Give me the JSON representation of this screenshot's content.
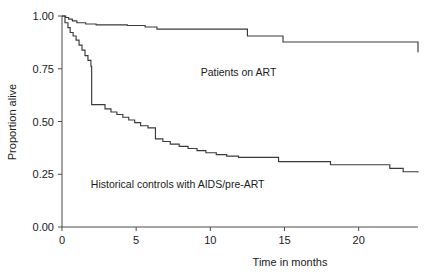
{
  "chart_data": {
    "type": "line",
    "title": "",
    "subtitle": "",
    "xlabel": "Time in months",
    "ylabel": "Proportion alive",
    "xlim": [
      0,
      24
    ],
    "ylim": [
      0,
      1
    ],
    "grid": false,
    "legend_position": "inline-annotation",
    "x_ticks": [
      0,
      5,
      10,
      15,
      20
    ],
    "x_tick_labels": [
      "0",
      "5",
      "10",
      "15",
      "20"
    ],
    "y_ticks": [
      0.0,
      0.25,
      0.5,
      0.75,
      1.0
    ],
    "y_tick_labels": [
      "0.00",
      "0.25",
      "0.50",
      "0.75",
      "1.00"
    ],
    "series": [
      {
        "name": "Patients on ART",
        "annotation": "Patients on ART",
        "annotation_x": 11.9,
        "annotation_y": 0.715,
        "step": "post",
        "x": [
          0.0,
          0.25,
          0.45,
          0.7,
          1.0,
          1.6,
          2.3,
          4.4,
          5.6,
          6.4,
          11.6,
          12.5,
          14.9,
          24.0
        ],
        "y": [
          1.0,
          0.993,
          0.985,
          0.977,
          0.968,
          0.962,
          0.958,
          0.955,
          0.948,
          0.938,
          0.938,
          0.905,
          0.877,
          0.828
        ]
      },
      {
        "name": "Historical controls with AIDS/pre-ART",
        "annotation": "Historical controls with AIDS/pre-ART",
        "annotation_x": 7.8,
        "annotation_y": 0.185,
        "step": "post",
        "x": [
          0.0,
          0.2,
          0.4,
          0.55,
          0.75,
          0.95,
          1.15,
          1.35,
          1.55,
          1.75,
          1.95,
          2.0,
          2.9,
          3.3,
          3.7,
          4.1,
          4.5,
          4.9,
          5.3,
          5.8,
          6.3,
          6.8,
          7.3,
          7.9,
          8.5,
          9.1,
          9.7,
          10.4,
          11.1,
          11.9,
          14.6,
          18.1,
          22.1,
          23.0,
          24.0
        ],
        "y": [
          1.0,
          0.968,
          0.945,
          0.922,
          0.905,
          0.886,
          0.862,
          0.838,
          0.812,
          0.79,
          0.762,
          0.58,
          0.56,
          0.545,
          0.533,
          0.52,
          0.507,
          0.495,
          0.48,
          0.47,
          0.418,
          0.405,
          0.393,
          0.382,
          0.372,
          0.362,
          0.352,
          0.343,
          0.336,
          0.33,
          0.31,
          0.295,
          0.278,
          0.262,
          0.258
        ]
      }
    ]
  },
  "axes": {
    "y_label": "Proportion alive",
    "x_label": "Time in months"
  }
}
